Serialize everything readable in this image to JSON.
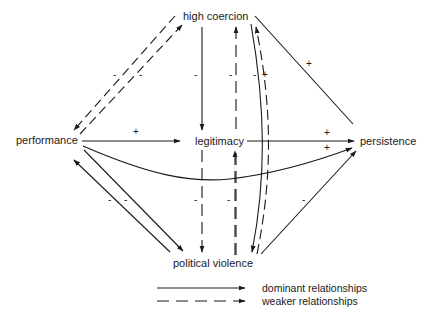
{
  "nodes": {
    "high_coercion": "high coercion",
    "performance": "performance",
    "legitimacy": "legitimacy",
    "persistence": "persistence",
    "political_violence": "political violence"
  },
  "edges": [
    {
      "from": "performance",
      "to": "high coercion",
      "style": "weaker",
      "sign": "-"
    },
    {
      "from": "high coercion",
      "to": "performance",
      "style": "weaker",
      "sign": "-"
    },
    {
      "from": "high coercion",
      "to": "legitimacy",
      "style": "dominant",
      "sign": "-"
    },
    {
      "from": "political violence",
      "to": "high coercion",
      "style": "weaker",
      "sign": "-"
    },
    {
      "from": "high coercion",
      "to": "political violence",
      "style": "dominant",
      "sign": "-"
    },
    {
      "from": "political violence",
      "to": "high coercion",
      "style": "weaker",
      "sign": "+"
    },
    {
      "from": "high coercion",
      "to": "persistence",
      "style": "dominant",
      "sign": "+"
    },
    {
      "from": "performance",
      "to": "legitimacy",
      "style": "dominant",
      "sign": "+"
    },
    {
      "from": "legitimacy",
      "to": "persistence",
      "style": "dominant",
      "sign": "+"
    },
    {
      "from": "performance",
      "to": "persistence",
      "style": "dominant",
      "sign": "+"
    },
    {
      "from": "performance",
      "to": "political violence",
      "style": "dominant",
      "sign": "-"
    },
    {
      "from": "political violence",
      "to": "performance",
      "style": "dominant",
      "sign": "-"
    },
    {
      "from": "legitimacy",
      "to": "political violence",
      "style": "weaker",
      "sign": "-"
    },
    {
      "from": "political violence",
      "to": "persistence",
      "style": "dominant",
      "sign": "-"
    }
  ],
  "signs": {
    "s1": "-",
    "s2": "-",
    "s3": "-",
    "s4": "-",
    "s5": "-",
    "s6": "+",
    "s7": "+",
    "s8": "+",
    "s9": "+",
    "s10": "+",
    "s11": "-",
    "s12": "-",
    "s13": "-",
    "s14": "-",
    "s15": "-"
  },
  "legend": {
    "dominant": "dominant relationships",
    "weaker": "weaker relationships"
  }
}
